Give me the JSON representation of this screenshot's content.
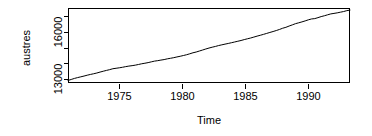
{
  "chart_data": {
    "type": "line",
    "title": "",
    "xlabel": "Time",
    "ylabel": "austres",
    "xlim": [
      1971.25,
      1993.25
    ],
    "ylim": [
      12900,
      17800
    ],
    "xticks": [
      1975,
      1980,
      1985,
      1990
    ],
    "xticklabels": [
      "1975",
      "1980",
      "1985",
      "1990"
    ],
    "yticks": [
      13000,
      14000,
      15000,
      16000,
      17000
    ],
    "yticklabels": [
      "13000",
      "",
      "",
      "16000",
      ""
    ],
    "yticklabels_shown": [
      "13000",
      "16000"
    ],
    "grid": false,
    "legend": null,
    "series": [
      {
        "name": "austres",
        "x": [
          1971.25,
          1971.5,
          1971.75,
          1972.0,
          1972.25,
          1972.5,
          1972.75,
          1973.0,
          1973.25,
          1973.5,
          1973.75,
          1974.0,
          1974.25,
          1974.5,
          1974.75,
          1975.0,
          1975.25,
          1975.5,
          1975.75,
          1976.0,
          1976.25,
          1976.5,
          1976.75,
          1977.0,
          1977.25,
          1977.5,
          1977.75,
          1978.0,
          1978.25,
          1978.5,
          1978.75,
          1979.0,
          1979.25,
          1979.5,
          1979.75,
          1980.0,
          1980.25,
          1980.5,
          1980.75,
          1981.0,
          1981.25,
          1981.5,
          1981.75,
          1982.0,
          1982.25,
          1982.5,
          1982.75,
          1983.0,
          1983.25,
          1983.5,
          1983.75,
          1984.0,
          1984.25,
          1984.5,
          1984.75,
          1985.0,
          1985.25,
          1985.5,
          1985.75,
          1986.0,
          1986.25,
          1986.5,
          1986.75,
          1987.0,
          1987.25,
          1987.5,
          1987.75,
          1988.0,
          1988.25,
          1988.5,
          1988.75,
          1989.0,
          1989.25,
          1989.5,
          1989.75,
          1990.0,
          1990.25,
          1990.5,
          1990.75,
          1991.0,
          1991.25,
          1991.5,
          1991.75,
          1992.0,
          1992.25,
          1992.5,
          1992.75,
          1993.0,
          1993.25
        ],
        "y": [
          13067.3,
          13130.5,
          13198.4,
          13254.2,
          13303.7,
          13353.9,
          13409.3,
          13459.2,
          13504.5,
          13552.6,
          13614.3,
          13669.5,
          13722.6,
          13772.1,
          13832.0,
          13862.6,
          13893.0,
          13926.8,
          13968.9,
          14004.7,
          14033.1,
          14066.0,
          14110.1,
          14155.6,
          14192.2,
          14231.7,
          14281.5,
          14330.3,
          14359.3,
          14396.6,
          14430.8,
          14478.4,
          14515.7,
          14554.9,
          14602.5,
          14646.4,
          14695.4,
          14746.6,
          14807.4,
          14874.4,
          14923.3,
          14988.7,
          15054.1,
          15121.7,
          15184.2,
          15239.3,
          15288.9,
          15346.2,
          15393.5,
          15439.0,
          15483.5,
          15531.5,
          15579.4,
          15628.5,
          15677.3,
          15736.7,
          15788.3,
          15839.7,
          15900.6,
          15961.5,
          16018.3,
          16076.9,
          16139.0,
          16203.0,
          16263.3,
          16327.9,
          16398.9,
          16478.3,
          16538.2,
          16621.6,
          16697.0,
          16777.2,
          16833.1,
          16891.6,
          16956.8,
          17026.3,
          17085.4,
          17106.9,
          17169.4,
          17239.4,
          17292.0,
          17354.2,
          17414.2,
          17447.3,
          17482.6,
          17526.0,
          17568.7,
          17627.1,
          17661.5
        ]
      }
    ]
  },
  "geometry": {
    "plot_left": 68,
    "plot_right": 350,
    "plot_top": 8,
    "plot_bottom": 83
  }
}
